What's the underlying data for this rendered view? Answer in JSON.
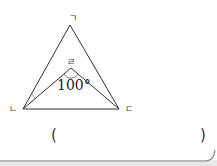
{
  "diagram": {
    "vertices": {
      "top": {
        "label": "ㄱ",
        "x": 70,
        "y": 25
      },
      "inner": {
        "label": "ㄹ",
        "x": 71,
        "y": 68
      },
      "left": {
        "label": "ㄴ",
        "x": 23,
        "y": 109
      },
      "right": {
        "label": "ㄷ",
        "x": 119,
        "y": 109
      }
    },
    "angle_label": "100°",
    "colors": {
      "line": "#333333",
      "border": "#888888"
    }
  },
  "answer": {
    "open_paren": "(",
    "close_paren": ")"
  }
}
